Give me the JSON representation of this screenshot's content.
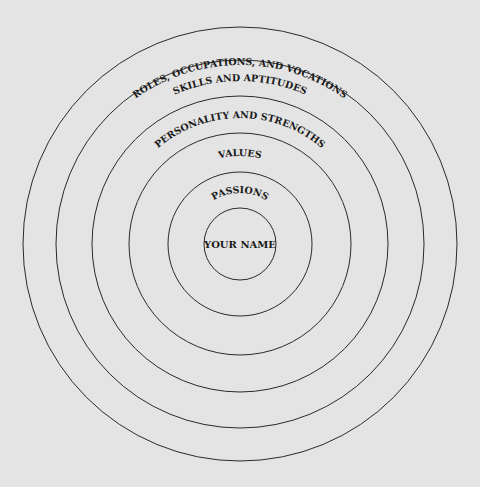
{
  "diagram": {
    "background_color": "#e4e4e4",
    "line_color": "#2a2a2a",
    "center": {
      "x": 240,
      "y": 244
    },
    "rings": [
      {
        "name": "roles",
        "radius": 217,
        "label": "ROLES, OCCUPATIONS, AND VOCATIONS",
        "label_radius": 199,
        "font_size": 9.5
      },
      {
        "name": "skills",
        "radius": 184,
        "label": "SKILLS AND APTITUDES",
        "label_radius": 163,
        "font_size": 9.5
      },
      {
        "name": "personality",
        "radius": 148,
        "label": "PERSONALITY AND STRENGTHS",
        "label_radius": 126,
        "font_size": 9.5
      },
      {
        "name": "values",
        "radius": 111,
        "label": "VALUES",
        "label_radius": 88,
        "font_size": 9.5
      },
      {
        "name": "passions",
        "radius": 72,
        "label": "PASSIONS",
        "label_radius": 51,
        "font_size": 9.5
      },
      {
        "name": "your-name",
        "radius": 36,
        "label": "YOUR NAME",
        "font_size": 10
      }
    ]
  }
}
